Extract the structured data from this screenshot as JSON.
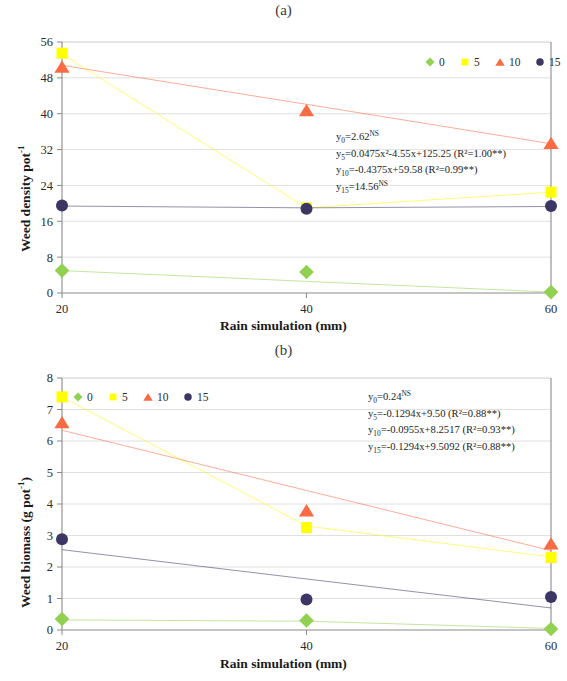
{
  "figure": {
    "panel_a_label": "(a)",
    "panel_b_label": "(b)",
    "x_axis_title": "Rain simulation (mm)",
    "y_axis_title_a": "Weed density pot",
    "y_axis_title_a_sup": "-1",
    "y_axis_title_b": "Weed biomass (g pot",
    "y_axis_title_b_sup": "-1",
    "y_axis_title_b_tail": ")"
  },
  "legend": {
    "items": [
      {
        "label": "0",
        "marker": "diamond-marker",
        "color": "#92d050"
      },
      {
        "label": "5",
        "marker": "square-marker",
        "color": "#ffff00"
      },
      {
        "label": "10",
        "marker": "triangle-marker",
        "color": "#fa6a43"
      },
      {
        "label": "15",
        "marker": "circle-marker",
        "color": "#3b3663"
      }
    ]
  },
  "chart_data": [
    {
      "type": "scatter",
      "title": "(a)",
      "xlabel": "Rain simulation (mm)",
      "ylabel": "Weed density pot -1",
      "x": [
        20,
        40,
        60
      ],
      "xlim": [
        20,
        60
      ],
      "ylim": [
        0,
        56
      ],
      "xticks": [
        "20",
        "40",
        "60"
      ],
      "yticks": [
        "0",
        "8",
        "16",
        "24",
        "32",
        "40",
        "48",
        "56"
      ],
      "grid": true,
      "legend_position": "top-right",
      "series": [
        {
          "name": "0",
          "marker": "diamond",
          "color": "#92d050",
          "values": [
            5.0,
            4.7,
            0.2
          ],
          "trend": [
            5.0,
            2.6,
            0.2
          ]
        },
        {
          "name": "5",
          "marker": "square",
          "color": "#ffff00",
          "values": [
            53.5,
            19.0,
            22.5
          ],
          "trend": [
            53.3,
            19.0,
            22.5
          ]
        },
        {
          "name": "10",
          "marker": "triangle",
          "color": "#fa6a43",
          "values": [
            50.5,
            40.8,
            33.5
          ],
          "trend": [
            50.8,
            42.1,
            33.3
          ]
        },
        {
          "name": "15",
          "marker": "circle",
          "color": "#3b3663",
          "values": [
            19.5,
            18.8,
            19.4
          ],
          "trend": [
            19.4,
            19.0,
            19.3
          ]
        }
      ],
      "annotations": [
        {
          "lhs": "y",
          "sub": "0",
          "text": "=2.62",
          "sup": "NS"
        },
        {
          "lhs": "y",
          "sub": "5",
          "text": "=0.0475x²-4.55x+125.25 (R²=1.00**)",
          "sup": ""
        },
        {
          "lhs": "y",
          "sub": "10",
          "text": "=-0.4375x+59.58 (R²=0.99**)",
          "sup": ""
        },
        {
          "lhs": "y",
          "sub": "15",
          "text": "=14.56",
          "sup": "NS"
        }
      ]
    },
    {
      "type": "scatter",
      "title": "(b)",
      "xlabel": "Rain simulation (mm)",
      "ylabel": "Weed biomass (g pot -1 )",
      "x": [
        20,
        40,
        60
      ],
      "xlim": [
        20,
        60
      ],
      "ylim": [
        0,
        8
      ],
      "xticks": [
        "20",
        "40",
        "60"
      ],
      "yticks": [
        "0",
        "1",
        "2",
        "3",
        "4",
        "5",
        "6",
        "7",
        "8"
      ],
      "grid": true,
      "legend_position": "top-left",
      "series": [
        {
          "name": "0",
          "marker": "diamond",
          "color": "#92d050",
          "values": [
            0.35,
            0.3,
            0.03
          ],
          "trend": [
            0.32,
            0.28,
            0.05
          ]
        },
        {
          "name": "5",
          "marker": "square",
          "color": "#ffff00",
          "values": [
            7.4,
            3.25,
            2.3
          ],
          "trend": [
            7.4,
            3.3,
            2.32
          ]
        },
        {
          "name": "10",
          "marker": "triangle",
          "color": "#fa6a43",
          "values": [
            6.6,
            3.8,
            2.75
          ],
          "trend": [
            6.34,
            4.43,
            2.52
          ]
        },
        {
          "name": "15",
          "marker": "circle",
          "color": "#3b3663",
          "values": [
            2.88,
            0.97,
            1.05
          ],
          "trend": [
            2.55,
            1.62,
            0.7
          ]
        }
      ],
      "annotations": [
        {
          "lhs": "y",
          "sub": "0",
          "text": "=0.24",
          "sup": "NS"
        },
        {
          "lhs": "y",
          "sub": "5",
          "text": "=-0.1294x+9.50 (R²=0.88**)",
          "sup": ""
        },
        {
          "lhs": "y",
          "sub": "10",
          "text": "=-0.0955x+8.2517 (R²=0.93**)",
          "sup": ""
        },
        {
          "lhs": "y",
          "sub": "15",
          "text": "=-0.1294x+9.5092 (R²=0.88**)",
          "sup": ""
        }
      ]
    }
  ]
}
